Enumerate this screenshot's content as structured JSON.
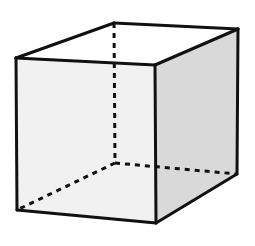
{
  "diagram": {
    "type": "wireframe-cube",
    "colors": {
      "background": "#ffffff",
      "edge": "#111111",
      "front_face_fill": "#f1f1f1",
      "side_face_fill": "#d9d9d9",
      "top_face_fill": "#ffffff"
    },
    "vertices": {
      "front_top_left": [
        16,
        58
      ],
      "front_top_right": [
        155,
        65
      ],
      "front_bottom_left": [
        17,
        210
      ],
      "front_bottom_right": [
        156,
        223
      ],
      "back_top_left": [
        114,
        23
      ],
      "back_top_right": [
        238,
        29
      ],
      "back_bottom_right": [
        237,
        174
      ],
      "back_bottom_left": [
        115,
        163
      ]
    },
    "faces": [
      {
        "name": "front",
        "visible": true,
        "shaded": "light"
      },
      {
        "name": "right-side",
        "visible": true,
        "shaded": "medium"
      },
      {
        "name": "top",
        "visible": true,
        "shaded": "none"
      }
    ],
    "edges": {
      "visible_count": 9,
      "hidden_count": 3
    }
  }
}
